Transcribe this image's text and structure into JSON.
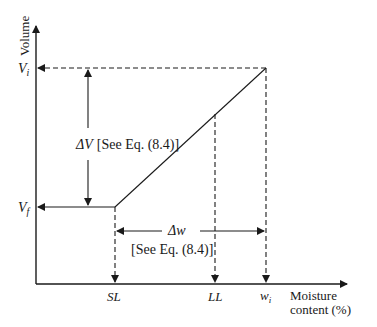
{
  "diagram": {
    "type": "shrinkage-limit volume vs moisture content",
    "y_axis": {
      "label": "Volume"
    },
    "x_axis": {
      "label_line1": "Moisture",
      "label_line2": "content (%)"
    },
    "y_ticks": {
      "initial_volume": "V",
      "initial_volume_sub": "i",
      "final_volume": "V",
      "final_volume_sub": "f"
    },
    "x_ticks": {
      "shrinkage_limit": "SL",
      "liquid_limit": "LL",
      "initial_moisture": "w",
      "initial_moisture_sub": "i"
    },
    "annotations": {
      "delta_v_symbol": "ΔV",
      "delta_v_ref": "[See Eq. (8.4)]",
      "delta_w_symbol": "Δw",
      "delta_w_ref": "[See Eq. (8.4)]"
    },
    "colors": {
      "ink": "#1a1a1a",
      "background": "#ffffff"
    }
  }
}
